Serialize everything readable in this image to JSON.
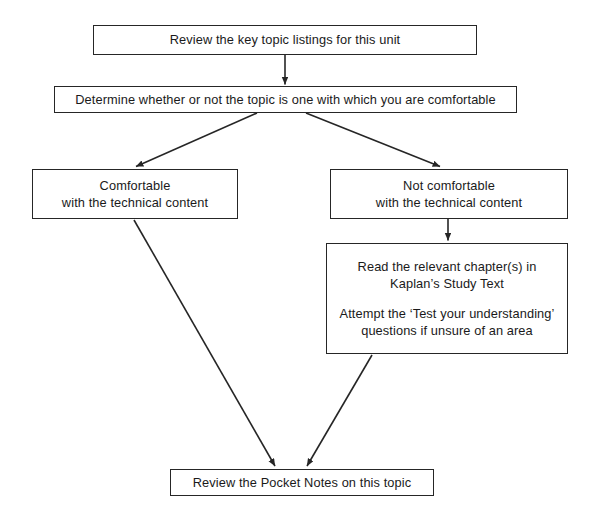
{
  "diagram": {
    "background_color": "#ffffff",
    "stroke_color": "#262626",
    "text_color": "#1a1a1a",
    "width": 604,
    "height": 524,
    "nodes": [
      {
        "id": "review-key-topics",
        "lines": [
          "Review the key topic listings for this unit"
        ]
      },
      {
        "id": "determine",
        "lines": [
          "Determine whether or not the topic is one with which you are comfortable"
        ]
      },
      {
        "id": "comfortable",
        "lines": [
          "Comfortable",
          "with the technical content"
        ]
      },
      {
        "id": "not-comfortable",
        "lines": [
          "Not comfortable",
          "with the technical content"
        ]
      },
      {
        "id": "read-chapters",
        "lines": [
          "Read the relevant chapter(s) in",
          "Kaplan’s Study Text",
          "",
          "Attempt the ‘Test your understanding’",
          "questions if unsure of an area"
        ]
      },
      {
        "id": "pocket-notes",
        "lines": [
          "Review the Pocket Notes on this topic"
        ]
      }
    ],
    "connectors": [
      {
        "from": "review-key-topics",
        "to": "determine",
        "style": "straight-down-arrow"
      },
      {
        "from": "determine",
        "to": "comfortable",
        "style": "diagonal-left-arrow"
      },
      {
        "from": "determine",
        "to": "not-comfortable",
        "style": "diagonal-right-arrow"
      },
      {
        "from": "not-comfortable",
        "to": "read-chapters",
        "style": "straight-down-arrow"
      },
      {
        "from": "comfortable",
        "to": "pocket-notes",
        "style": "diagonal-right-arrow"
      },
      {
        "from": "read-chapters",
        "to": "pocket-notes",
        "style": "diagonal-left-arrow"
      }
    ]
  }
}
